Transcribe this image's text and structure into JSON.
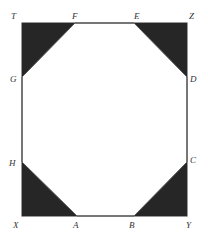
{
  "diagram": {
    "colors": {
      "stroke": "#555555",
      "fill": "#262626",
      "label": "#333333",
      "background": "#ffffff"
    },
    "labels": {
      "T": "T",
      "F": "F",
      "E": "E",
      "Z": "Z",
      "G": "G",
      "D": "D",
      "H": "H",
      "C": "C",
      "X": "X",
      "A": "A",
      "B": "B",
      "Y": "Y"
    },
    "points": {
      "T": [
        22,
        23
      ],
      "Z": [
        187,
        23
      ],
      "X": [
        22,
        216
      ],
      "Y": [
        187,
        216
      ],
      "F": [
        75,
        23
      ],
      "E": [
        134,
        23
      ],
      "G": [
        22,
        77
      ],
      "D": [
        187,
        77
      ],
      "H": [
        22,
        162
      ],
      "C": [
        187,
        162
      ],
      "A": [
        77,
        216
      ],
      "B": [
        134,
        216
      ]
    }
  }
}
